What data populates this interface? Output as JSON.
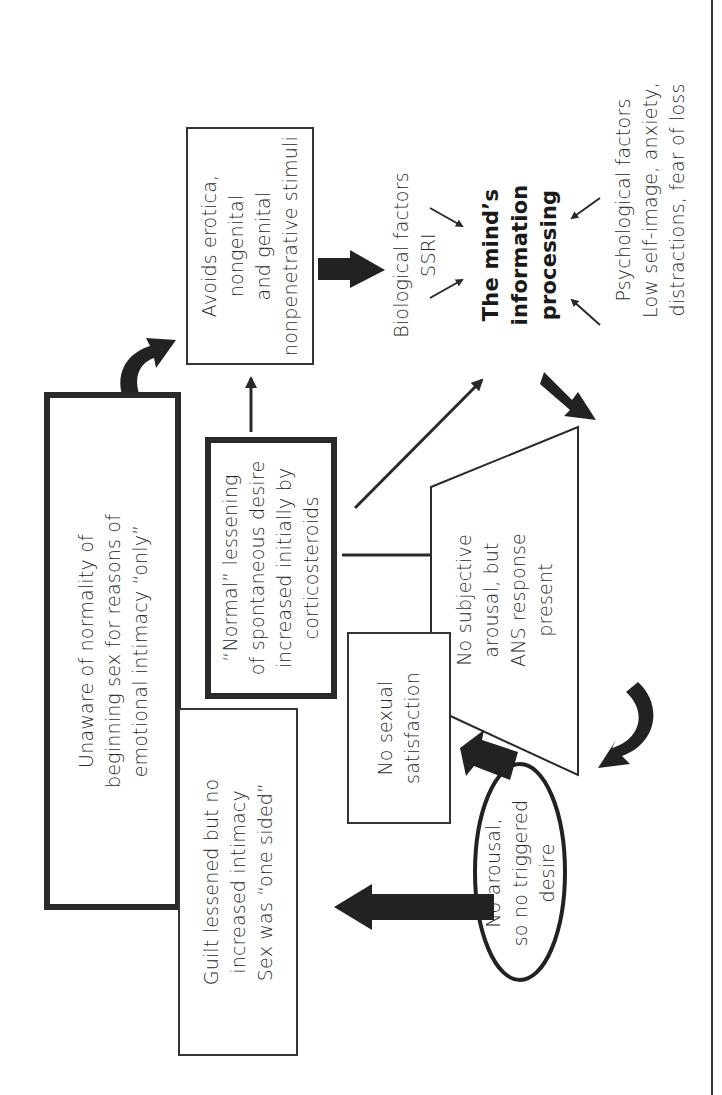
{
  "diagram": {
    "orientation": "rotated-90-ccw",
    "nodes": {
      "avoids": {
        "lines": [
          "Avoids erotica,",
          "nongenital",
          "and genital",
          "nonpenetrative stimuli"
        ]
      },
      "unaware": {
        "lines": [
          "Unaware of normality of",
          "beginning sex for reasons of",
          "emotional intimacy “only”"
        ]
      },
      "normal": {
        "lines": [
          "“Normal” lessening",
          "of spontaneous desire",
          "increased initially by",
          "corticosteroids"
        ]
      },
      "guilt": {
        "lines": [
          "Guilt lessened but no",
          "increased intimacy",
          "Sex was “one sided”"
        ]
      },
      "no_satisfaction": {
        "lines": [
          "No sexual",
          "satisfaction"
        ]
      },
      "no_subjective": {
        "lines": [
          "No subjective",
          "arousal, but",
          "ANS response",
          "present"
        ]
      },
      "no_arousal": {
        "lines": [
          "No arousal,",
          "so no triggered",
          "desire"
        ]
      },
      "minds_processing": {
        "lines": [
          "The mind’s",
          "information",
          "processing"
        ]
      },
      "biological": {
        "lines": [
          "Biological factors",
          "SSRI"
        ]
      },
      "psychological": {
        "lines": [
          "Psychological factors",
          "Low self-image, anxiety,",
          "distractions, fear of loss"
        ]
      }
    },
    "colors": {
      "stroke": "#2a2a2a",
      "background": "#ffffff",
      "text": "#2a2a2a"
    }
  }
}
